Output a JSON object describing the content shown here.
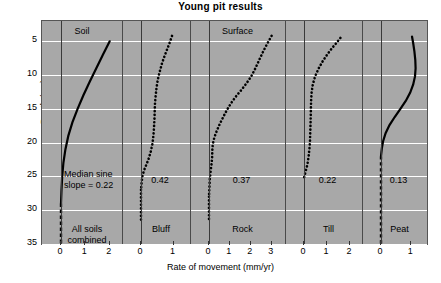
{
  "title": "Young pit results",
  "axes": {
    "ylabel": "Depth (cm)",
    "xlabel": "Rate of movement (mm/yr)",
    "yticks": [
      5,
      10,
      15,
      20,
      25,
      30,
      35
    ]
  },
  "group_labels": [
    {
      "text": "Soil",
      "panel": 0
    },
    {
      "text": "Surface",
      "panel": 2
    }
  ],
  "chart_data": {
    "type": "line",
    "title": "Young pit results",
    "xlabel": "Rate of movement (mm/yr)",
    "ylabel": "Depth (cm)",
    "ylim": [
      2,
      35
    ],
    "grid": true,
    "legend": "none",
    "orientation": "depth-profile",
    "panels": [
      {
        "name": "All soils combined",
        "label_lines": [
          "All soils",
          "combined"
        ],
        "median_sine_slope": "0.22",
        "annotation_lines": [
          "Median sine",
          "slope  = 0.22"
        ],
        "xlim": [
          0,
          2.3
        ],
        "xticks": [
          0,
          1,
          2
        ],
        "style": "solid",
        "points": [
          {
            "x": 2.0,
            "y": 5.0
          },
          {
            "x": 1.72,
            "y": 7.0
          },
          {
            "x": 1.45,
            "y": 9.0
          },
          {
            "x": 1.18,
            "y": 11.0
          },
          {
            "x": 0.92,
            "y": 13.0
          },
          {
            "x": 0.68,
            "y": 15.0
          },
          {
            "x": 0.47,
            "y": 17.0
          },
          {
            "x": 0.3,
            "y": 19.0
          },
          {
            "x": 0.18,
            "y": 21.0
          },
          {
            "x": 0.1,
            "y": 23.0
          },
          {
            "x": 0.05,
            "y": 25.0
          },
          {
            "x": 0.02,
            "y": 27.0
          },
          {
            "x": 0.0,
            "y": 29.0
          }
        ],
        "tail": {
          "style": "dashed",
          "x": 0.0,
          "from_y": 29.0,
          "to_y": 35.0
        }
      },
      {
        "name": "Bluff",
        "label_lines": [
          "Bluff"
        ],
        "median_sine_slope": "0.42",
        "annotation_lines": [
          "0.42"
        ],
        "xlim": [
          0,
          1.35
        ],
        "xticks": [
          0,
          1
        ],
        "style": "dotted",
        "points": [
          {
            "x": 0.95,
            "y": 4.2
          },
          {
            "x": 0.88,
            "y": 5.2
          },
          {
            "x": 0.8,
            "y": 6.2
          },
          {
            "x": 0.72,
            "y": 7.2
          },
          {
            "x": 0.64,
            "y": 8.3
          },
          {
            "x": 0.58,
            "y": 9.4
          },
          {
            "x": 0.52,
            "y": 10.6
          },
          {
            "x": 0.48,
            "y": 11.8
          },
          {
            "x": 0.45,
            "y": 13.0
          },
          {
            "x": 0.43,
            "y": 14.2
          },
          {
            "x": 0.42,
            "y": 15.4
          },
          {
            "x": 0.41,
            "y": 16.6
          },
          {
            "x": 0.4,
            "y": 17.8
          },
          {
            "x": 0.38,
            "y": 19.0
          },
          {
            "x": 0.35,
            "y": 20.2
          },
          {
            "x": 0.3,
            "y": 21.3
          },
          {
            "x": 0.24,
            "y": 22.3
          },
          {
            "x": 0.17,
            "y": 23.2
          },
          {
            "x": 0.1,
            "y": 24.0
          },
          {
            "x": 0.05,
            "y": 24.8
          },
          {
            "x": 0.02,
            "y": 25.8
          },
          {
            "x": 0.0,
            "y": 27.0
          }
        ],
        "tail": {
          "style": "dotted",
          "x": 0.0,
          "from_y": 27.0,
          "to_y": 31.5
        }
      },
      {
        "name": "Rock",
        "label_lines": [
          "Rock"
        ],
        "median_sine_slope": "0.37",
        "annotation_lines": [
          "0.37"
        ],
        "xlim": [
          0,
          3.4
        ],
        "xticks": [
          0,
          1,
          2,
          3
        ],
        "style": "dotted",
        "points": [
          {
            "x": 3.0,
            "y": 4.2
          },
          {
            "x": 2.78,
            "y": 5.4
          },
          {
            "x": 2.58,
            "y": 6.6
          },
          {
            "x": 2.4,
            "y": 7.8
          },
          {
            "x": 2.22,
            "y": 9.0
          },
          {
            "x": 2.02,
            "y": 10.2
          },
          {
            "x": 1.8,
            "y": 11.2
          },
          {
            "x": 1.55,
            "y": 12.2
          },
          {
            "x": 1.28,
            "y": 13.2
          },
          {
            "x": 1.05,
            "y": 14.2
          },
          {
            "x": 0.85,
            "y": 15.2
          },
          {
            "x": 0.68,
            "y": 16.2
          },
          {
            "x": 0.52,
            "y": 17.2
          },
          {
            "x": 0.38,
            "y": 18.2
          },
          {
            "x": 0.26,
            "y": 19.2
          },
          {
            "x": 0.18,
            "y": 20.2
          },
          {
            "x": 0.16,
            "y": 21.2
          },
          {
            "x": 0.15,
            "y": 22.2
          },
          {
            "x": 0.12,
            "y": 23.2
          },
          {
            "x": 0.08,
            "y": 24.2
          },
          {
            "x": 0.04,
            "y": 25.4
          },
          {
            "x": 0.02,
            "y": 26.6
          },
          {
            "x": 0.0,
            "y": 28.0
          }
        ],
        "tail": {
          "style": "dotted",
          "x": 0.0,
          "from_y": 28.0,
          "to_y": 31.5
        }
      },
      {
        "name": "Till",
        "label_lines": [
          "Till"
        ],
        "median_sine_slope": "0.22",
        "annotation_lines": [
          "0.22"
        ],
        "xlim": [
          0,
          2.3
        ],
        "xticks": [
          0,
          1,
          2
        ],
        "style": "dotted",
        "points": [
          {
            "x": 1.58,
            "y": 4.5
          },
          {
            "x": 1.42,
            "y": 5.2
          },
          {
            "x": 1.22,
            "y": 6.0
          },
          {
            "x": 1.02,
            "y": 6.9
          },
          {
            "x": 0.82,
            "y": 7.9
          },
          {
            "x": 0.64,
            "y": 9.0
          },
          {
            "x": 0.48,
            "y": 10.2
          },
          {
            "x": 0.38,
            "y": 11.4
          },
          {
            "x": 0.33,
            "y": 12.6
          },
          {
            "x": 0.31,
            "y": 13.8
          },
          {
            "x": 0.3,
            "y": 15.0
          },
          {
            "x": 0.29,
            "y": 16.2
          },
          {
            "x": 0.28,
            "y": 17.4
          },
          {
            "x": 0.27,
            "y": 18.6
          },
          {
            "x": 0.26,
            "y": 19.8
          },
          {
            "x": 0.24,
            "y": 20.8
          },
          {
            "x": 0.21,
            "y": 21.8
          },
          {
            "x": 0.17,
            "y": 22.8
          },
          {
            "x": 0.12,
            "y": 23.6
          },
          {
            "x": 0.06,
            "y": 24.4
          },
          {
            "x": 0.0,
            "y": 25.2
          }
        ],
        "tail": null
      },
      {
        "name": "Peat",
        "label_lines": [
          "Peat"
        ],
        "median_sine_slope": "0.13",
        "annotation_lines": [
          "0.13"
        ],
        "xlim": [
          0,
          1.35
        ],
        "xticks": [
          0,
          1
        ],
        "style": "solid",
        "points": [
          {
            "x": 1.02,
            "y": 4.3
          },
          {
            "x": 1.06,
            "y": 5.3
          },
          {
            "x": 1.1,
            "y": 6.5
          },
          {
            "x": 1.13,
            "y": 7.8
          },
          {
            "x": 1.14,
            "y": 9.0
          },
          {
            "x": 1.12,
            "y": 10.2
          },
          {
            "x": 1.06,
            "y": 11.4
          },
          {
            "x": 0.96,
            "y": 12.6
          },
          {
            "x": 0.82,
            "y": 13.8
          },
          {
            "x": 0.64,
            "y": 15.0
          },
          {
            "x": 0.45,
            "y": 16.2
          },
          {
            "x": 0.28,
            "y": 17.4
          },
          {
            "x": 0.15,
            "y": 18.6
          },
          {
            "x": 0.07,
            "y": 19.8
          },
          {
            "x": 0.03,
            "y": 20.8
          },
          {
            "x": 0.0,
            "y": 22.0
          }
        ],
        "tail": {
          "style": "dashed",
          "x": 0.0,
          "from_y": 22.0,
          "to_y": 35.0
        }
      }
    ]
  }
}
